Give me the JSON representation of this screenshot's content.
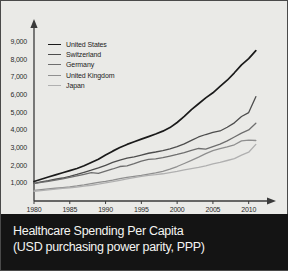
{
  "title": {
    "line1": "Healthcare Spending Per Capita",
    "line2": "(USD purchasing power parity, PPP)"
  },
  "colors": {
    "background": "#eaeae7",
    "border": "#4a4a4a",
    "axis": "#3a3a3a",
    "banner_bg": "#141414",
    "banner_text": "#f4f4f2",
    "united_states": "#1a1a1a",
    "switzerland": "#4d4d4d",
    "germany": "#6e6e6e",
    "united_kingdom": "#8f8f8f",
    "japan": "#b0b0b0"
  },
  "chart_data": {
    "type": "line",
    "title": "Healthcare Spending Per Capita",
    "subtitle": "(USD purchasing power parity, PPP)",
    "xlabel": "",
    "ylabel": "",
    "xlim": [
      1980,
      2012
    ],
    "ylim": [
      0,
      9500
    ],
    "grid": false,
    "legend_position": "top-left",
    "xticks": [
      1980,
      1985,
      1990,
      1995,
      2000,
      2005,
      2010
    ],
    "xtick_labels": [
      "1980",
      "1985",
      "1990",
      "1995",
      "2000",
      "2005",
      "2010"
    ],
    "yticks": [
      1000,
      2000,
      3000,
      4000,
      5000,
      6000,
      7000,
      8000,
      9000
    ],
    "ytick_labels": [
      "1,000",
      "2,000",
      "3,000",
      "4,000",
      "5,000",
      "6,000",
      "7,000",
      "8,000",
      "9,000"
    ],
    "x": [
      1980,
      1981,
      1982,
      1983,
      1984,
      1985,
      1986,
      1987,
      1988,
      1989,
      1990,
      1991,
      1992,
      1993,
      1994,
      1995,
      1996,
      1997,
      1998,
      1999,
      2000,
      2001,
      2002,
      2003,
      2004,
      2005,
      2006,
      2007,
      2008,
      2009,
      2010,
      2011
    ],
    "series": [
      {
        "name": "United States",
        "color": "#1a1a1a",
        "values": [
          1100,
          1230,
          1360,
          1480,
          1600,
          1720,
          1840,
          1990,
          2180,
          2360,
          2600,
          2820,
          3020,
          3200,
          3350,
          3500,
          3640,
          3790,
          3950,
          4150,
          4440,
          4780,
          5170,
          5500,
          5830,
          6120,
          6480,
          6830,
          7250,
          7700,
          8050,
          8500
        ]
      },
      {
        "name": "Switzerland",
        "color": "#4d4d4d",
        "values": [
          1000,
          1080,
          1150,
          1230,
          1300,
          1390,
          1500,
          1620,
          1740,
          1870,
          2020,
          2180,
          2310,
          2420,
          2500,
          2600,
          2700,
          2770,
          2850,
          2950,
          3070,
          3230,
          3430,
          3620,
          3760,
          3880,
          3960,
          4170,
          4420,
          4780,
          5000,
          5900
        ]
      },
      {
        "name": "Germany",
        "color": "#6e6e6e",
        "values": [
          980,
          1050,
          1110,
          1180,
          1250,
          1330,
          1420,
          1510,
          1610,
          1560,
          1690,
          1810,
          1950,
          1990,
          2110,
          2250,
          2350,
          2380,
          2450,
          2540,
          2630,
          2740,
          2860,
          2970,
          2930,
          3080,
          3220,
          3400,
          3620,
          3840,
          4020,
          4400
        ]
      },
      {
        "name": "United Kingdom",
        "color": "#8f8f8f",
        "values": [
          600,
          640,
          680,
          720,
          760,
          800,
          850,
          910,
          980,
          1050,
          1110,
          1180,
          1270,
          1330,
          1390,
          1450,
          1520,
          1590,
          1680,
          1800,
          1950,
          2120,
          2300,
          2480,
          2680,
          2850,
          2960,
          3060,
          3180,
          3400,
          3440,
          3420
        ]
      },
      {
        "name": "Japan",
        "color": "#b0b0b0",
        "values": [
          550,
          590,
          630,
          670,
          710,
          750,
          790,
          840,
          890,
          950,
          1020,
          1090,
          1170,
          1250,
          1320,
          1390,
          1450,
          1490,
          1540,
          1610,
          1680,
          1760,
          1830,
          1900,
          1990,
          2100,
          2180,
          2290,
          2400,
          2590,
          2760,
          3200
        ]
      }
    ]
  },
  "legend": {
    "items": [
      {
        "label": "United States"
      },
      {
        "label": "Switzerland"
      },
      {
        "label": "Germany"
      },
      {
        "label": "United Kingdom"
      },
      {
        "label": "Japan"
      }
    ]
  }
}
